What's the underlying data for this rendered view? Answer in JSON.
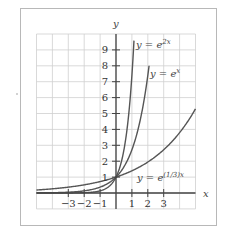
{
  "chart_data": {
    "type": "line",
    "title": "",
    "xlabel": "x",
    "ylabel": "y",
    "xlim": [
      -5,
      5
    ],
    "ylim": [
      -1,
      10
    ],
    "grid": true,
    "x_ticks": [
      -3,
      -2,
      -1,
      1,
      2,
      3
    ],
    "x_tick_labels": [
      "−3",
      "−2",
      "−1",
      "1",
      "2",
      "3"
    ],
    "y_ticks": [
      1,
      2,
      3,
      4,
      5,
      6,
      7,
      8,
      9
    ],
    "y_tick_labels": [
      "1",
      "2",
      "3",
      "4",
      "5",
      "6",
      "7",
      "8",
      "9"
    ],
    "series": [
      {
        "name": "y = e^{2x}",
        "label_base": "y = e",
        "label_sup": "2x",
        "k": 2,
        "x_range": [
          -5,
          1.13
        ],
        "x": [
          -5,
          -3,
          -2,
          -1,
          0,
          0.5,
          1,
          1.13
        ],
        "values": [
          5e-05,
          0.0025,
          0.018,
          0.135,
          1,
          2.72,
          7.39,
          9.58
        ]
      },
      {
        "name": "y = e^{x}",
        "label_base": "y = e",
        "label_sup": "x",
        "k": 1,
        "x_range": [
          -5,
          2.08
        ],
        "x": [
          -5,
          -3,
          -2,
          -1,
          0,
          1,
          2,
          2.08
        ],
        "values": [
          0.0067,
          0.05,
          0.135,
          0.368,
          1,
          2.72,
          7.39,
          8.0
        ]
      },
      {
        "name": "y = e^{(1/3)x}",
        "label_base": "y = e",
        "label_sup": "(1/3)x",
        "k": 0.3333333,
        "x_range": [
          -5,
          5
        ],
        "x": [
          -5,
          -3,
          -2,
          -1,
          0,
          1,
          2,
          3,
          4,
          5
        ],
        "values": [
          0.189,
          0.368,
          0.513,
          0.717,
          1,
          1.396,
          1.948,
          2.718,
          3.794,
          5.294
        ]
      }
    ],
    "annotations": [
      {
        "text": "y = e^{2x}",
        "x": 1.4,
        "y": 9.3
      },
      {
        "text": "y = e^{x}",
        "x": 2.3,
        "y": 7.4
      },
      {
        "text": "y = e^{(1/3)x}",
        "x": 1.4,
        "y": 0.9
      }
    ],
    "legend": "inline labels"
  }
}
